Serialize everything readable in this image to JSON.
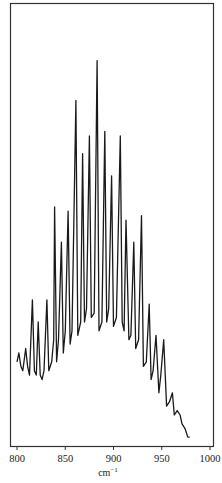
{
  "chart_data": {
    "type": "line",
    "title": "",
    "xlabel": "cm⁻¹",
    "xlabel_base": "cm",
    "xlabel_sup": "−1",
    "ylabel": "",
    "xlim": [
      795,
      1005
    ],
    "ylim": [
      0,
      100
    ],
    "grid": false,
    "legend": null,
    "x_ticks": [
      800,
      850,
      900,
      950,
      1000
    ],
    "x_tick_labels": [
      "800",
      "850",
      "900",
      "950",
      "1000"
    ],
    "series": [
      {
        "name": "spectrum",
        "color": "#1a1a1a",
        "x": [
          800,
          802,
          804,
          806,
          809,
          811,
          813,
          816,
          818,
          820,
          822,
          824,
          826,
          828,
          831,
          833,
          836,
          838,
          839,
          841,
          843,
          846,
          848,
          850,
          853,
          855,
          857,
          861,
          863,
          866,
          868,
          870,
          872,
          875,
          877,
          880,
          883,
          885,
          888,
          891,
          893,
          895,
          898,
          900,
          903,
          907,
          909,
          911,
          913,
          916,
          918,
          921,
          923,
          926,
          929,
          931,
          934,
          937,
          939,
          941,
          944,
          947,
          949,
          952,
          955,
          958,
          961,
          963,
          966,
          969,
          971,
          974,
          977,
          979
        ],
        "y": [
          19,
          21,
          18,
          17,
          22,
          18,
          16,
          33,
          17,
          16,
          28,
          16,
          15,
          17,
          33,
          17,
          19,
          24,
          54,
          19,
          24,
          46,
          21,
          26,
          53,
          23,
          26,
          78,
          25,
          28,
          66,
          28,
          31,
          70,
          29,
          30,
          87,
          26,
          28,
          71,
          28,
          31,
          61,
          27,
          29,
          70,
          28,
          26,
          51,
          24,
          25,
          46,
          22,
          24,
          52,
          18,
          19,
          32,
          15,
          17,
          25,
          12,
          16,
          24,
          9,
          10,
          12,
          7,
          8,
          7,
          5,
          4,
          2,
          2
        ]
      }
    ],
    "peaks": [
      {
        "x": 802,
        "rel": 21
      },
      {
        "x": 809,
        "rel": 22
      },
      {
        "x": 818,
        "rel": 33
      },
      {
        "x": 824,
        "rel": 28
      },
      {
        "x": 831,
        "rel": 33
      },
      {
        "x": 839,
        "rel": 54
      },
      {
        "x": 846,
        "rel": 46
      },
      {
        "x": 853,
        "rel": 53
      },
      {
        "x": 861,
        "rel": 78
      },
      {
        "x": 868,
        "rel": 66
      },
      {
        "x": 875,
        "rel": 70
      },
      {
        "x": 883,
        "rel": 87
      },
      {
        "x": 891,
        "rel": 71
      },
      {
        "x": 898,
        "rel": 61
      },
      {
        "x": 907,
        "rel": 70
      },
      {
        "x": 913,
        "rel": 51
      },
      {
        "x": 921,
        "rel": 46
      },
      {
        "x": 929,
        "rel": 52
      },
      {
        "x": 937,
        "rel": 32
      },
      {
        "x": 944,
        "rel": 25
      },
      {
        "x": 952,
        "rel": 24
      },
      {
        "x": 961,
        "rel": 12
      },
      {
        "x": 969,
        "rel": 7
      }
    ]
  }
}
